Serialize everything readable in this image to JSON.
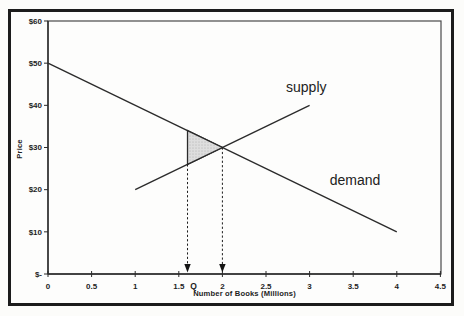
{
  "figure": {
    "background": "#fdfdfc",
    "border_color": "#1c1c1c",
    "axis_color": "#2a2a2a",
    "plot_border_color": "#4a4a4a"
  },
  "chart_data": {
    "type": "line",
    "title": "",
    "xlabel": "Number of Books (Millions)",
    "ylabel": "Price",
    "xlim": [
      0,
      4.5
    ],
    "ylim": [
      0,
      60
    ],
    "grid": false,
    "legend": "inline-labels",
    "x_tick_values": [
      0,
      0.5,
      1,
      1.5,
      2,
      2.5,
      3,
      3.5,
      4,
      4.5
    ],
    "x_tick_labels": [
      "0",
      "0.5",
      "1",
      "1.5",
      "2",
      "2.5",
      "3",
      "3.5",
      "4",
      "4.5"
    ],
    "y_tick_values": [
      0,
      10,
      20,
      30,
      40,
      50,
      60
    ],
    "y_tick_labels": [
      "$-",
      "$10",
      "$20",
      "$30",
      "$40",
      "$50",
      "$60"
    ],
    "series": [
      {
        "name": "supply",
        "label": "supply",
        "points": [
          [
            1,
            20
          ],
          [
            3,
            40
          ]
        ],
        "label_at": [
          2.73,
          43.2
        ],
        "color": "#2b2b2b"
      },
      {
        "name": "demand",
        "label": "demand",
        "points": [
          [
            0,
            50
          ],
          [
            4,
            10
          ]
        ],
        "label_at": [
          3.23,
          21.0
        ],
        "color": "#2b2b2b"
      }
    ],
    "equilibrium": {
      "quantity": 2,
      "price": 30
    },
    "restricted_quantity": {
      "label": "Q",
      "value": 1.6
    },
    "dashed_drop_lines": [
      {
        "x": 1.6,
        "from_price": 26,
        "arrowhead": "down"
      },
      {
        "x": 2.0,
        "from_price": 30,
        "arrowhead": "down"
      }
    ],
    "shaded_triangle": {
      "vertices": [
        [
          1.6,
          34
        ],
        [
          1.6,
          26
        ],
        [
          2,
          30
        ]
      ],
      "fill": "#dddddd",
      "stroke": "#2b2b2b"
    }
  }
}
